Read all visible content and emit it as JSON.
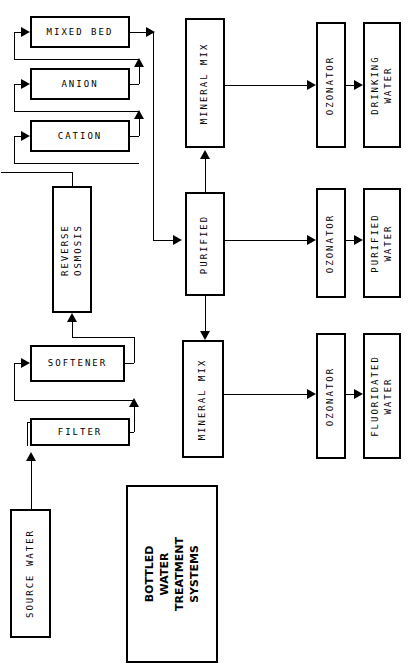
{
  "diagram": {
    "title": "BOTTLED\nWATER\nTREATMENT\nSYSTEMS",
    "nodes": {
      "mixed_bed": "MIXED BED",
      "anion": "ANION",
      "cation": "CATION",
      "reverse_osmosis": "REVERSE\nOSMOSIS",
      "softener": "SOFTENER",
      "filter": "FILTER",
      "source_water": "SOURCE WATER",
      "mineral_mix_top": "MINERAL MIX",
      "purified": "PURIFIED",
      "mineral_mix_bottom": "MINERAL MIX",
      "ozonator_top": "OZONATOR",
      "ozonator_mid": "OZONATOR",
      "ozonator_bottom": "OZONATOR",
      "drinking_water": "DRINKING\nWATER",
      "purified_water": "PURIFIED\nWATER",
      "fluoridated_water": "FLUORIDATED\nWATER"
    },
    "colors": {
      "line": "#000000",
      "background": "#ffffff",
      "text": "#000000"
    }
  }
}
